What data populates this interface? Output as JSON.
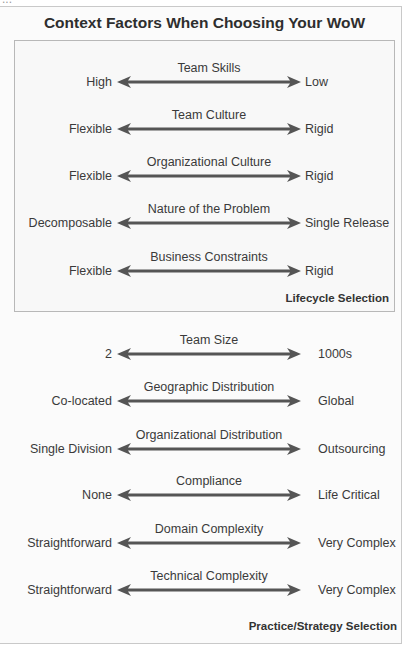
{
  "title": "Context Factors When Choosing Your WoW",
  "colors": {
    "arrow": "#555555",
    "text": "#3a3a3a",
    "box_border": "#b8b8b8"
  },
  "lifecycle_section": {
    "label": "Lifecycle Selection",
    "factors": [
      {
        "name": "Team Skills",
        "left": "High",
        "right": "Low"
      },
      {
        "name": "Team Culture",
        "left": "Flexible",
        "right": "Rigid"
      },
      {
        "name": "Organizational Culture",
        "left": "Flexible",
        "right": "Rigid"
      },
      {
        "name": "Nature of the Problem",
        "left": "Decomposable",
        "right": "Single Release"
      },
      {
        "name": "Business Constraints",
        "left": "Flexible",
        "right": "Rigid"
      }
    ]
  },
  "practice_section": {
    "label": "Practice/Strategy Selection",
    "factors": [
      {
        "name": "Team Size",
        "left": "2",
        "right": "1000s"
      },
      {
        "name": "Geographic Distribution",
        "left": "Co-located",
        "right": "Global"
      },
      {
        "name": "Organizational Distribution",
        "left": "Single Division",
        "right": "Outsourcing"
      },
      {
        "name": "Compliance",
        "left": "None",
        "right": "Life Critical"
      },
      {
        "name": "Domain Complexity",
        "left": "Straightforward",
        "right": "Very Complex"
      },
      {
        "name": "Technical Complexity",
        "left": "Straightforward",
        "right": "Very Complex"
      }
    ]
  }
}
